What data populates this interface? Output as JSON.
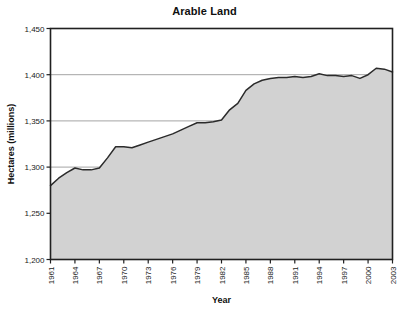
{
  "chart_data": {
    "type": "area",
    "title": "Arable Land",
    "xlabel": "Year",
    "ylabel": "Hectares (millions)",
    "xlim": [
      1961,
      2003
    ],
    "ylim": [
      1200,
      1450
    ],
    "ytick_labels": [
      "1,450",
      "1,400",
      "1,350",
      "1,300",
      "1,250",
      "1,200"
    ],
    "ytick_values": [
      1450,
      1400,
      1350,
      1300,
      1250,
      1200
    ],
    "xtick_labels": [
      "1961",
      "1964",
      "1967",
      "1970",
      "1973",
      "1976",
      "1979",
      "1982",
      "1985",
      "1988",
      "1991",
      "1994",
      "1997",
      "2000",
      "2003"
    ],
    "xtick_values": [
      1961,
      1964,
      1967,
      1970,
      1973,
      1976,
      1979,
      1982,
      1985,
      1988,
      1991,
      1994,
      1997,
      2000,
      2003
    ],
    "grid": "horizontal",
    "gridlines_at": [
      1400,
      1350,
      1300
    ],
    "legend": "none",
    "series_name": "Arable Land",
    "line_color": "#2b2b2b",
    "fill_color": "#d2d2d2",
    "frame_color": "#202020",
    "background_color": "#ffffff",
    "x": [
      1961,
      1962,
      1963,
      1964,
      1965,
      1966,
      1967,
      1968,
      1969,
      1970,
      1971,
      1972,
      1973,
      1974,
      1975,
      1976,
      1977,
      1978,
      1979,
      1980,
      1981,
      1982,
      1983,
      1984,
      1985,
      1986,
      1987,
      1988,
      1989,
      1990,
      1991,
      1992,
      1993,
      1994,
      1995,
      1996,
      1997,
      1998,
      1999,
      2000,
      2001,
      2002,
      2003
    ],
    "values": [
      1280,
      1288,
      1294,
      1299,
      1297,
      1297,
      1299,
      1310,
      1322,
      1322,
      1321,
      1324,
      1327,
      1330,
      1333,
      1336,
      1340,
      1344,
      1348,
      1348,
      1349,
      1351,
      1362,
      1369,
      1383,
      1390,
      1394,
      1396,
      1397,
      1397,
      1398,
      1397,
      1398,
      1401,
      1399,
      1399,
      1398,
      1399,
      1396,
      1400,
      1407,
      1406,
      1403
    ]
  }
}
